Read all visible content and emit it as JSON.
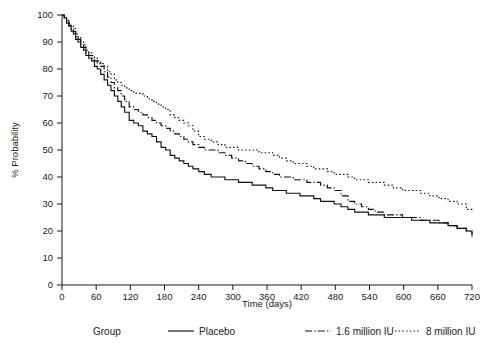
{
  "chart_data": {
    "type": "line",
    "title": "",
    "subtitle": "",
    "xlabel": "Time (days)",
    "ylabel": "% Probability",
    "xlim": [
      0,
      720
    ],
    "ylim": [
      0,
      100
    ],
    "xticks": [
      0,
      60,
      120,
      180,
      240,
      300,
      360,
      420,
      480,
      540,
      600,
      660,
      720
    ],
    "yticks": [
      0,
      10,
      20,
      30,
      40,
      50,
      60,
      70,
      80,
      90,
      100
    ],
    "grid": false,
    "legend_position": "bottom",
    "legend_title": "Group",
    "step_style": "post",
    "series": [
      {
        "name": "Placebo",
        "style": "solid",
        "x": [
          0,
          4,
          8,
          12,
          16,
          20,
          24,
          28,
          33,
          38,
          42,
          47,
          52,
          57,
          62,
          68,
          74,
          80,
          86,
          92,
          98,
          104,
          110,
          118,
          126,
          134,
          142,
          150,
          158,
          166,
          174,
          182,
          190,
          198,
          206,
          214,
          222,
          230,
          240,
          250,
          262,
          274,
          286,
          298,
          310,
          322,
          334,
          346,
          358,
          370,
          382,
          394,
          406,
          418,
          430,
          442,
          454,
          466,
          478,
          490,
          502,
          514,
          526,
          538,
          550,
          566,
          582,
          598,
          614,
          630,
          646,
          662,
          678,
          694,
          710,
          720
        ],
        "y": [
          100,
          99,
          97,
          96,
          94,
          93,
          91,
          90,
          88,
          87,
          85,
          84,
          83,
          81,
          80,
          78,
          76,
          74,
          72,
          70,
          68,
          66,
          64,
          61,
          60,
          59,
          57,
          56,
          55,
          53,
          51,
          50,
          48,
          47,
          46,
          45,
          44,
          43,
          42,
          41,
          40,
          40,
          39,
          39,
          38,
          38,
          37,
          37,
          36,
          35,
          35,
          34,
          34,
          33,
          33,
          32,
          31,
          31,
          30,
          29,
          28,
          27,
          27,
          26,
          26,
          25,
          25,
          25,
          24,
          24,
          23,
          23,
          22,
          21,
          20,
          18
        ]
      },
      {
        "name": "1.6 million IU",
        "style": "dashdot",
        "x": [
          0,
          4,
          8,
          12,
          16,
          20,
          24,
          28,
          33,
          38,
          42,
          47,
          52,
          57,
          62,
          68,
          74,
          80,
          86,
          92,
          98,
          104,
          110,
          118,
          126,
          134,
          142,
          150,
          158,
          166,
          174,
          182,
          190,
          198,
          206,
          214,
          222,
          230,
          240,
          250,
          262,
          274,
          286,
          298,
          310,
          322,
          334,
          346,
          358,
          370,
          382,
          394,
          406,
          418,
          430,
          442,
          454,
          466,
          478,
          490,
          502,
          514,
          526,
          538,
          550,
          566,
          582,
          598,
          614,
          630,
          646,
          662,
          678,
          694,
          710,
          720
        ],
        "y": [
          100,
          99,
          98,
          96,
          95,
          94,
          92,
          91,
          89,
          88,
          86,
          85,
          84,
          83,
          82,
          81,
          79,
          77,
          75,
          73,
          72,
          70,
          68,
          66,
          65,
          64,
          63,
          62,
          61,
          60,
          59,
          58,
          57,
          56,
          55,
          54,
          53,
          52,
          51,
          50,
          50,
          49,
          48,
          47,
          46,
          45,
          44,
          43,
          42,
          41,
          40,
          40,
          39,
          39,
          38,
          38,
          37,
          36,
          35,
          33,
          31,
          30,
          29,
          28,
          27,
          26,
          26,
          25,
          25,
          24,
          24,
          23,
          22,
          21,
          20,
          19
        ]
      },
      {
        "name": "8 million IU",
        "style": "dotted",
        "x": [
          0,
          4,
          8,
          12,
          16,
          20,
          24,
          28,
          33,
          38,
          42,
          47,
          52,
          57,
          62,
          68,
          74,
          80,
          86,
          92,
          98,
          104,
          110,
          118,
          126,
          134,
          142,
          150,
          158,
          166,
          174,
          182,
          190,
          198,
          206,
          214,
          222,
          230,
          240,
          250,
          262,
          274,
          286,
          298,
          310,
          322,
          334,
          346,
          358,
          370,
          382,
          394,
          406,
          418,
          430,
          442,
          454,
          466,
          478,
          490,
          502,
          514,
          526,
          538,
          550,
          566,
          582,
          598,
          614,
          630,
          646,
          662,
          678,
          694,
          710,
          720
        ],
        "y": [
          100,
          99,
          98,
          97,
          96,
          95,
          93,
          92,
          90,
          89,
          87,
          86,
          85,
          84,
          83,
          82,
          81,
          79,
          78,
          76,
          75,
          74,
          73,
          72,
          71,
          71,
          70,
          69,
          68,
          67,
          66,
          65,
          63,
          62,
          61,
          60,
          59,
          57,
          55,
          54,
          53,
          52,
          51,
          51,
          50,
          50,
          50,
          49,
          49,
          48,
          47,
          46,
          45,
          45,
          44,
          43,
          43,
          42,
          41,
          41,
          40,
          39,
          39,
          38,
          38,
          37,
          36,
          35,
          35,
          34,
          33,
          32,
          31,
          30,
          28,
          27
        ]
      }
    ]
  },
  "legend": {
    "title": "Group",
    "items": [
      {
        "label": "Placebo",
        "style": "solid"
      },
      {
        "label": "1.6 million IU",
        "style": "dashdot"
      },
      {
        "label": "8 million IU",
        "style": "dotted"
      }
    ]
  },
  "axes": {
    "x_title": "Time (days)",
    "y_title": "% Probability"
  }
}
